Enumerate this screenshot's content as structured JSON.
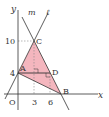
{
  "diagram": {
    "type": "coordinate-geometry",
    "axes": {
      "x_label": "x",
      "y_label": "y",
      "origin_label": "O"
    },
    "ticks": {
      "x": [
        "3",
        "6"
      ],
      "y": [
        "4",
        "10"
      ]
    },
    "lines": {
      "m": "m",
      "l": "ℓ"
    },
    "points": {
      "A": "A",
      "B": "B",
      "C": "C",
      "D": "D"
    },
    "coordinates": {
      "A": [
        0,
        4
      ],
      "C": [
        3,
        10
      ],
      "D": [
        6,
        4
      ],
      "B": [
        8,
        0
      ]
    },
    "triangle_fill": "#f4b6be",
    "triangle_stroke": "#333333"
  }
}
